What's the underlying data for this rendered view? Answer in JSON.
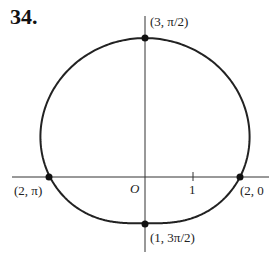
{
  "problem_number": "34.",
  "chart_data": {
    "type": "line",
    "title": "",
    "curve": "r = 2 + sin(theta)",
    "origin_label": "O",
    "tick_labels": [
      "1"
    ],
    "points": [
      {
        "label": "(3, π/2)",
        "r": 3,
        "theta": "π/2",
        "x": 0,
        "y": 3
      },
      {
        "label": "(2, π)",
        "r": 2,
        "theta": "π",
        "x": -2,
        "y": 0
      },
      {
        "label": "(2, 0)",
        "r": 2,
        "theta": "0",
        "x": 2,
        "y": 0
      },
      {
        "label": "(1, 3π/2)",
        "r": 1,
        "theta": "3π/2",
        "x": 0,
        "y": -1
      }
    ],
    "grid": false,
    "xlim": [
      -2.8,
      2.6
    ],
    "ylim": [
      -1.6,
      3.2
    ]
  },
  "labels": {
    "origin": "O",
    "tick_one": "1",
    "p_top": "(3, π/2)",
    "p_left": "(2, π)",
    "p_right": "(2, 0",
    "p_bottom": "(1, 3π/2)"
  }
}
